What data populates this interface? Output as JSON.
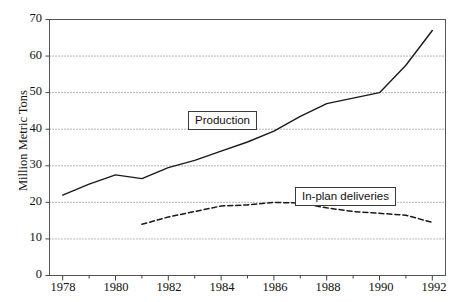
{
  "chart_data": {
    "type": "line",
    "title": "",
    "xlabel": "",
    "ylabel": "Million Metric Tons",
    "xlim": [
      1977.5,
      1992.5
    ],
    "ylim": [
      0,
      70
    ],
    "yticks": [
      0,
      10,
      20,
      30,
      40,
      50,
      60,
      70
    ],
    "xticks": [
      1978,
      1980,
      1982,
      1984,
      1986,
      1988,
      1990,
      1992
    ],
    "xticks_minor": [
      1979,
      1981,
      1983,
      1985,
      1987,
      1989,
      1991
    ],
    "grid": "horizontal-dotted",
    "legend": "inline-boxed-labels",
    "series": [
      {
        "name": "Production",
        "style": "solid",
        "color": "#1a1a1a",
        "x": [
          1978,
          1979,
          1980,
          1981,
          1982,
          1983,
          1984,
          1985,
          1986,
          1987,
          1988,
          1989,
          1990,
          1991,
          1992
        ],
        "values": [
          22,
          25,
          27.5,
          26.5,
          29.5,
          31.5,
          34,
          36.5,
          39.5,
          43.5,
          47,
          48.5,
          50,
          57.5,
          67
        ]
      },
      {
        "name": "In-plan deliveries",
        "style": "dashed",
        "color": "#1a1a1a",
        "x": [
          1981,
          1982,
          1983,
          1984,
          1985,
          1986,
          1987,
          1988,
          1989,
          1990,
          1991,
          1992
        ],
        "values": [
          14,
          16,
          17.5,
          19,
          19.3,
          20,
          19.8,
          18.5,
          17.5,
          17,
          16.5,
          14.5
        ]
      }
    ],
    "annotations": [
      {
        "text": "Production",
        "x": 1984.2,
        "y": 41.5
      },
      {
        "text": "In-plan deliveries",
        "x": 1987.4,
        "y": 24.0
      }
    ]
  },
  "axes": {
    "y_title": "Million Metric Tons",
    "y_tick_labels": [
      "70",
      "60",
      "50",
      "40",
      "30",
      "20",
      "10",
      "0"
    ],
    "x_tick_labels": [
      "1978",
      "1980",
      "1982",
      "1984",
      "1986",
      "1988",
      "1990",
      "1992"
    ]
  }
}
